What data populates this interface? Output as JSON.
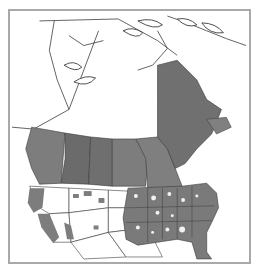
{
  "map": {
    "title": "North America species range map",
    "region": "North America",
    "legend": {
      "range_fill": "#7d7d7d",
      "range_fill_dark": "#6b6b6b",
      "land_fill": "#ffffff",
      "boundary_color": "#3a3a3a",
      "frame_color": "#a9a9a9"
    },
    "shaded_regions": [
      "British Columbia",
      "Alberta",
      "Saskatchewan",
      "Manitoba",
      "Ontario",
      "Quebec",
      "Western US patches",
      "Eastern United States",
      "Southeastern United States",
      "Florida"
    ],
    "unshaded_regions": [
      "Alaska",
      "Yukon",
      "Northwest Territories",
      "Nunavut",
      "Greenland",
      "Mexico"
    ]
  }
}
